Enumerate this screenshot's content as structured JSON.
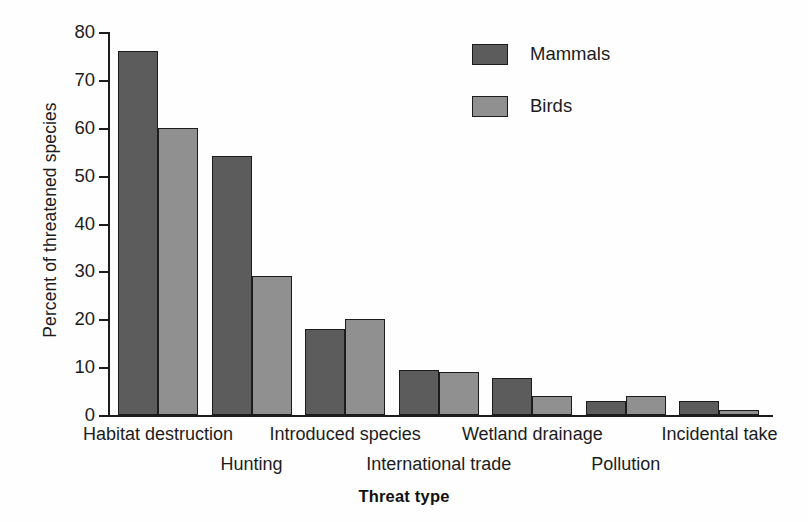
{
  "chart_data": {
    "type": "bar",
    "title": "",
    "xlabel": "Threat type",
    "ylabel": "Percent of threatened species",
    "categories": [
      "Habitat destruction",
      "Hunting",
      "Introduced species",
      "International trade",
      "Wetland drainage",
      "Pollution",
      "Incidental take"
    ],
    "series": [
      {
        "name": "Mammals",
        "color": "#5c5c5c",
        "values": [
          76,
          54,
          18,
          9.5,
          7.7,
          3,
          3
        ]
      },
      {
        "name": "Birds",
        "color": "#909090",
        "values": [
          60,
          29,
          20,
          9,
          4,
          4,
          1
        ]
      }
    ],
    "ylim": [
      0,
      80
    ],
    "yticks": [
      0,
      10,
      20,
      30,
      40,
      50,
      60,
      70,
      80
    ],
    "ytick_labels": [
      "0",
      "10",
      "20",
      "30",
      "40",
      "50",
      "60",
      "70",
      "80"
    ],
    "grid": false,
    "legend_position": "upper right",
    "legend_entries": [
      "Mammals",
      "Birds"
    ],
    "category_label_rows": [
      0,
      1,
      0,
      1,
      0,
      1,
      0
    ]
  },
  "axis": {
    "y_title": "Percent of threatened species",
    "x_title": "Threat type"
  },
  "legend": {
    "items": [
      {
        "label": "Mammals"
      },
      {
        "label": "Birds"
      }
    ]
  }
}
